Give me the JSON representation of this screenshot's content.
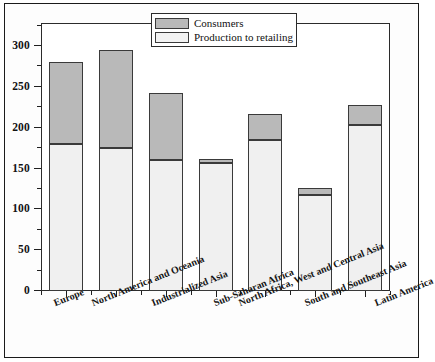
{
  "chart_data": {
    "type": "bar",
    "subtype": "stacked-bar",
    "title": "",
    "xlabel": "",
    "ylabel": "",
    "ylim": [
      0,
      312
    ],
    "ytick_values": [
      0,
      50,
      100,
      150,
      200,
      250,
      300
    ],
    "ytick_labels": [
      "0",
      "50",
      "100",
      "150",
      "200",
      "250",
      "300"
    ],
    "yminor_interval": 25,
    "grid": false,
    "legend_position": "top-center-right",
    "categories": [
      "Europe",
      "North America and Oceania",
      "Industrialized Asia",
      "Sub-Saharan Africa",
      "North Africa, West and Central Asia",
      "South and Southeast Asia",
      "Latin America"
    ],
    "series": [
      {
        "name": "Production to retailing",
        "color": "#f0f0f0",
        "values": [
          180,
          175,
          160,
          157,
          185,
          118,
          203
        ]
      },
      {
        "name": "Consumers",
        "color": "#b9b9b9",
        "values": [
          100,
          120,
          82,
          5,
          32,
          8,
          25
        ]
      }
    ],
    "totals": [
      280,
      295,
      242,
      162,
      217,
      126,
      228
    ]
  },
  "legend": {
    "items": [
      {
        "label": "Consumers",
        "swatch": "consumers-swatch"
      },
      {
        "label": "Production to retailing",
        "swatch": "production-swatch"
      }
    ]
  },
  "colors": {
    "consumers": "#b9b9b9",
    "production": "#f0f0f0",
    "frame": "#1a1a1a",
    "axis": "#1f1f1f",
    "background": "#ffffff"
  }
}
